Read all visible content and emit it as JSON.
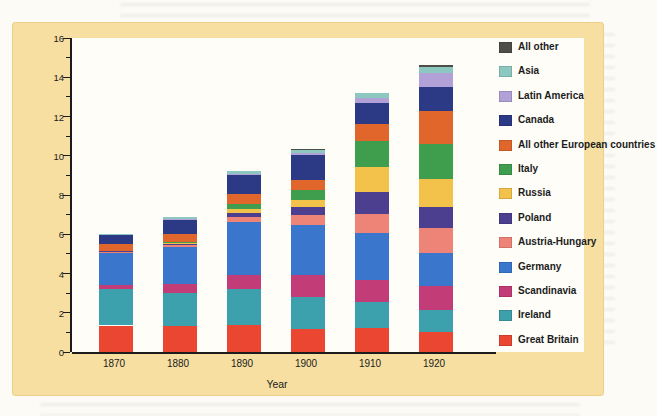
{
  "chart_data": {
    "type": "bar",
    "stacked": true,
    "title": "",
    "xlabel": "Year",
    "ylabel": "Population (in millions)",
    "ylim": [
      0,
      16
    ],
    "ytick_step": 2,
    "ytick_minor_step": 1,
    "grid": false,
    "legend_position": "right",
    "categories": [
      "1870",
      "1880",
      "1890",
      "1900",
      "1910",
      "1920"
    ],
    "series_order": "bottom-to-top of stack; legend shown in reverse (top-to-bottom)",
    "series": [
      {
        "name": "Great Britain",
        "color": "#ea4632",
        "values": [
          1.35,
          1.35,
          1.4,
          1.15,
          1.2,
          1.0
        ]
      },
      {
        "name": "Ireland",
        "color": "#3da0ad",
        "values": [
          1.85,
          1.65,
          1.8,
          1.65,
          1.35,
          1.15
        ]
      },
      {
        "name": "Scandinavia",
        "color": "#c23d77",
        "values": [
          0.2,
          0.45,
          0.7,
          1.1,
          1.1,
          1.2
        ]
      },
      {
        "name": "Germany",
        "color": "#3a76cb",
        "values": [
          1.65,
          1.9,
          2.7,
          2.55,
          2.4,
          1.7
        ]
      },
      {
        "name": "Austria-Hungary",
        "color": "#ee8377",
        "values": [
          0.05,
          0.1,
          0.3,
          0.55,
          1.0,
          1.25
        ]
      },
      {
        "name": "Poland",
        "color": "#4c3f90",
        "values": [
          0.05,
          0.05,
          0.2,
          0.4,
          1.1,
          1.1
        ]
      },
      {
        "name": "Russia",
        "color": "#f2c24a",
        "values": [
          0.0,
          0.05,
          0.2,
          0.35,
          1.3,
          1.4
        ]
      },
      {
        "name": "Italy",
        "color": "#3f9d4e",
        "values": [
          0.0,
          0.05,
          0.25,
          0.5,
          1.3,
          1.8
        ]
      },
      {
        "name": "All other European countries",
        "color": "#e0662c",
        "values": [
          0.35,
          0.4,
          0.5,
          0.5,
          0.85,
          1.7
        ]
      },
      {
        "name": "Canada",
        "color": "#2c3a85",
        "values": [
          0.45,
          0.75,
          0.95,
          1.3,
          1.1,
          1.2
        ]
      },
      {
        "name": "Latin America",
        "color": "#b2a1d6",
        "values": [
          0.0,
          0.05,
          0.05,
          0.1,
          0.25,
          0.7
        ]
      },
      {
        "name": "Asia",
        "color": "#8cc8c0",
        "values": [
          0.05,
          0.1,
          0.15,
          0.15,
          0.25,
          0.3
        ]
      },
      {
        "name": "All other",
        "color": "#4e4e48",
        "values": [
          0.0,
          0.0,
          0.0,
          0.05,
          0.0,
          0.1
        ]
      }
    ],
    "totals": [
      6.0,
      6.9,
      9.2,
      10.35,
      13.2,
      14.6
    ]
  },
  "colors": {
    "card_background": "#f6dfa1",
    "plot_background": "#fefdf8",
    "axis": "#1c1c1c"
  }
}
